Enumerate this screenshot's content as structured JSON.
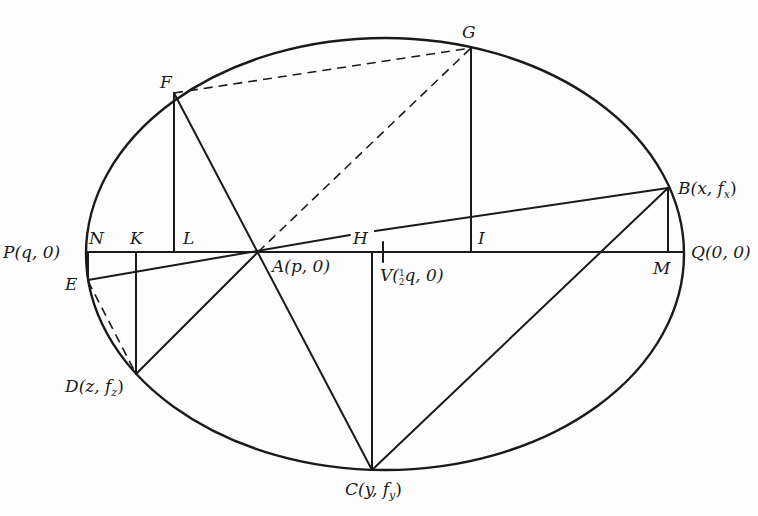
{
  "diagram": {
    "type": "geometric construction",
    "curve": {
      "shape": "ellipse",
      "cx": 385,
      "cy": 254,
      "rx": 299,
      "ry": 216
    },
    "points": {
      "P": {
        "label": "P",
        "coord": "(q, 0)",
        "x": 86,
        "y": 252
      },
      "Q": {
        "label": "Q",
        "coord": "(0, 0)",
        "x": 684,
        "y": 252
      },
      "A": {
        "label": "A",
        "coord": "(p, 0)",
        "x": 258,
        "y": 252
      },
      "B": {
        "label": "B",
        "coord": "(x, f",
        "sub": "x",
        "x": 668,
        "y": 188
      },
      "C": {
        "label": "C",
        "coord": "(y, f",
        "sub": "y",
        "x": 372,
        "y": 470
      },
      "D": {
        "label": "D",
        "coord": "(z, f",
        "sub": "z",
        "x": 136,
        "y": 374
      },
      "E": {
        "label": "E",
        "x": 87,
        "y": 281
      },
      "F": {
        "label": "F",
        "x": 174,
        "y": 93
      },
      "G": {
        "label": "G",
        "x": 471,
        "y": 48
      },
      "H": {
        "label": "H",
        "x": 360,
        "y": 233
      },
      "I": {
        "label": "I",
        "x": 471,
        "y": 252
      },
      "K": {
        "label": "K",
        "x": 136,
        "y": 252
      },
      "L": {
        "label": "L",
        "x": 174,
        "y": 252
      },
      "M": {
        "label": "M",
        "x": 668,
        "y": 252
      },
      "N": {
        "label": "N",
        "x": 90,
        "y": 252
      },
      "V": {
        "label": "V",
        "coord_pre": "(",
        "frac": "1/2",
        "coord_post": "q, 0)",
        "x": 383,
        "y": 252
      }
    },
    "labels": {
      "P": "P(q, 0)",
      "Q": "Q(0, 0)",
      "A": "A(p, 0)",
      "B_main": "B(x, f",
      "B_sub": "x",
      "C_main": "C(y, f",
      "C_sub": "y",
      "D_main": "D(z, f",
      "D_sub": "z",
      "E": "E",
      "F": "F",
      "G": "G",
      "H": "H",
      "I": "I",
      "K": "K",
      "L": "L",
      "M": "M",
      "N": "N",
      "V_main": "V(",
      "V_frac_num": "1",
      "V_frac_den": "2",
      "V_rest": "q, 0)"
    },
    "solid_segments": [
      "PQ",
      "FL",
      "GI",
      "BM",
      "DK",
      "C-foot",
      "FC",
      "EB",
      "DB-via-A",
      "CB",
      "PE"
    ],
    "dashed_segments": [
      "FG",
      "AG",
      "ED"
    ]
  }
}
